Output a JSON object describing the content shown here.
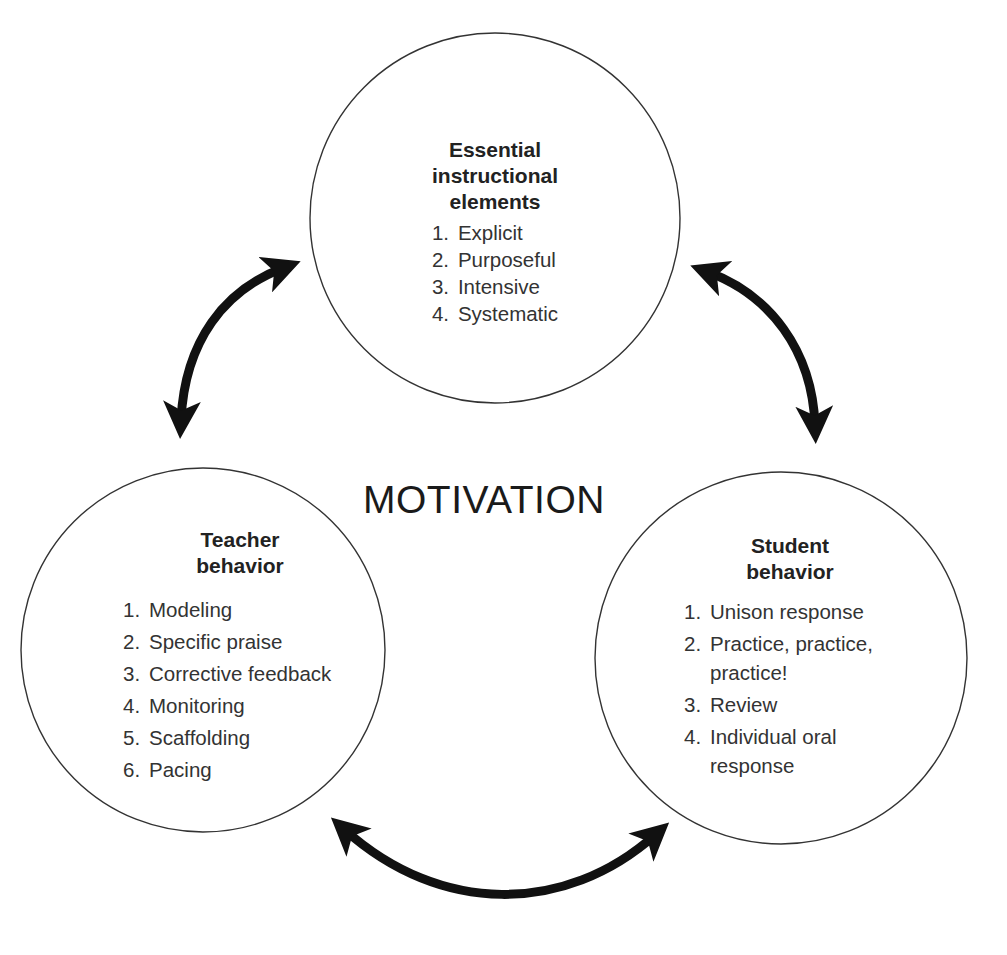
{
  "diagram": {
    "center_label": "MOTIVATION",
    "nodes": [
      {
        "id": "essential-elements",
        "heading_lines": [
          "Essential",
          "instructional",
          "elements"
        ],
        "items": [
          {
            "num": "1.",
            "text": "Explicit"
          },
          {
            "num": "2.",
            "text": "Purposeful"
          },
          {
            "num": "3.",
            "text": "Intensive"
          },
          {
            "num": "4.",
            "text": "Systematic"
          }
        ]
      },
      {
        "id": "teacher-behavior",
        "heading_lines": [
          "Teacher",
          "behavior"
        ],
        "items": [
          {
            "num": "1.",
            "text": "Modeling"
          },
          {
            "num": "2.",
            "text": "Specific praise"
          },
          {
            "num": "3.",
            "text": "Corrective feedback"
          },
          {
            "num": "4.",
            "text": "Monitoring"
          },
          {
            "num": "5.",
            "text": "Scaffolding"
          },
          {
            "num": "6.",
            "text": "Pacing"
          }
        ]
      },
      {
        "id": "student-behavior",
        "heading_lines": [
          "Student",
          "behavior"
        ],
        "items": [
          {
            "num": "1.",
            "text": "Unison response"
          },
          {
            "num": "2.",
            "text": "Practice, practice, practice!"
          },
          {
            "num": "3.",
            "text": "Review"
          },
          {
            "num": "4.",
            "text": "Individual oral response"
          }
        ]
      }
    ],
    "connections": [
      {
        "from": "essential-elements",
        "to": "teacher-behavior",
        "type": "double-arrow-icon"
      },
      {
        "from": "essential-elements",
        "to": "student-behavior",
        "type": "double-arrow-icon"
      },
      {
        "from": "teacher-behavior",
        "to": "student-behavior",
        "type": "double-arrow-icon"
      }
    ],
    "colors": {
      "stroke": "#333333",
      "arrow": "#111111",
      "text": "#222222",
      "background": "#ffffff"
    }
  }
}
